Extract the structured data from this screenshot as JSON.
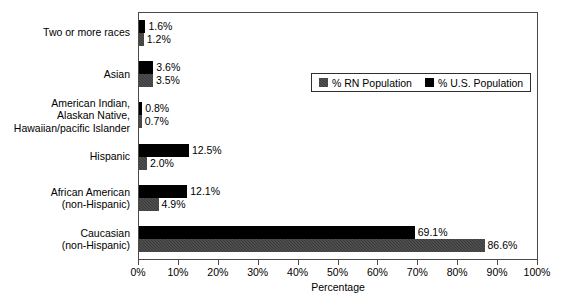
{
  "chart_data": {
    "type": "bar",
    "orientation": "horizontal",
    "title": "",
    "xlabel": "Percentage",
    "ylabel": "",
    "xlim": [
      0,
      100
    ],
    "xticks": [
      "0%",
      "10%",
      "20%",
      "30%",
      "40%",
      "50%",
      "60%",
      "70%",
      "80%",
      "90%",
      "100%"
    ],
    "xtick_values": [
      0,
      10,
      20,
      30,
      40,
      50,
      60,
      70,
      80,
      90,
      100
    ],
    "grid": false,
    "legend_position": "upper right inside",
    "categories": [
      "Two or more races",
      "Asian",
      "American Indian,\nAlaskan Native,\nHawaiian/pacific Islander",
      "Hispanic",
      "African American\n(non-Hispanic)",
      "Caucasian\n(non-Hispanic)"
    ],
    "series": [
      {
        "name": "% U.S. Population",
        "color": "#000000",
        "values": [
          1.6,
          3.6,
          0.8,
          12.5,
          12.1,
          69.1
        ],
        "labels": [
          "1.6%",
          "3.6%",
          "0.8%",
          "12.5%",
          "12.1%",
          "69.1%"
        ]
      },
      {
        "name": "% RN Population",
        "color": "#3a3a3a",
        "values": [
          1.2,
          3.5,
          0.7,
          2.0,
          4.9,
          86.6
        ],
        "labels": [
          "1.2%",
          "3.5%",
          "0.7%",
          "2.0%",
          "4.9%",
          "86.6%"
        ]
      }
    ]
  },
  "category_labels": [
    {
      "lines": [
        "Two or more races"
      ]
    },
    {
      "lines": [
        "Asian"
      ]
    },
    {
      "lines": [
        "American Indian,",
        "Alaskan Native,",
        "Hawaiian/pacific Islander"
      ]
    },
    {
      "lines": [
        "Hispanic"
      ]
    },
    {
      "lines": [
        "African American",
        "(non-Hispanic)"
      ]
    },
    {
      "lines": [
        "Caucasian",
        "(non-Hispanic)"
      ]
    }
  ],
  "legend": {
    "entries": [
      {
        "label": "% RN Population",
        "swatch": "rn"
      },
      {
        "label": "% U.S. Population",
        "swatch": "us"
      }
    ]
  },
  "axis": {
    "x_title": "Percentage",
    "tick_labels": [
      "0%",
      "10%",
      "20%",
      "30%",
      "40%",
      "50%",
      "60%",
      "70%",
      "80%",
      "90%",
      "100%"
    ]
  }
}
